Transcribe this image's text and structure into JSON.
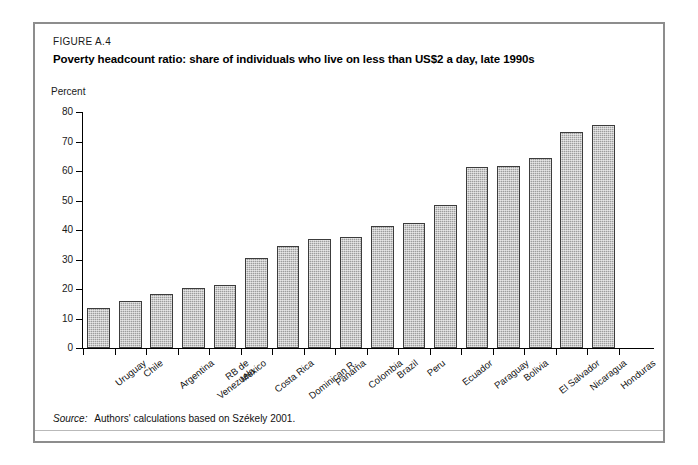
{
  "figure": {
    "number": "FIGURE A.4",
    "title": "Poverty headcount ratio: share of individuals who live on less than US$2 a day, late 1990s",
    "source_word": "Source:",
    "source_text": "Authors' calculations based on Székely 2001."
  },
  "chart_data": {
    "type": "bar",
    "title": "Poverty headcount ratio: share of individuals who live on less than US$2 a day, late 1990s",
    "xlabel": "",
    "ylabel": "Percent",
    "ylim": [
      0,
      80
    ],
    "yticks": [
      0,
      10,
      20,
      30,
      40,
      50,
      60,
      70,
      80
    ],
    "ytick_labels": [
      "0",
      "10",
      "20",
      "30",
      "40",
      "50",
      "60",
      "70",
      "80"
    ],
    "grid": false,
    "legend": "none",
    "bar_color": "#9d9d9d",
    "bar_border_color": "#3c3c3c",
    "categories": [
      "Uruguay",
      "Chile",
      "Argentina",
      "RB de Venezuela",
      "Mexico",
      "Costa Rica",
      "Dominican R.",
      "Panama",
      "Colombia",
      "Brazil",
      "Peru",
      "Ecuador",
      "Paraguay",
      "Bolivia",
      "El Salvador",
      "Nicaragua",
      "Honduras"
    ],
    "category_lines": [
      [
        "Uruguay"
      ],
      [
        "Chile"
      ],
      [
        "Argentina"
      ],
      [
        "RB de",
        "Venezuela"
      ],
      [
        "Mexico"
      ],
      [
        "Costa Rica"
      ],
      [
        "Dominican R."
      ],
      [
        "Panama"
      ],
      [
        "Colombia"
      ],
      [
        "Brazil"
      ],
      [
        "Peru"
      ],
      [
        "Ecuador"
      ],
      [
        "Paraguay"
      ],
      [
        "Bolivia"
      ],
      [
        "El Salvador"
      ],
      [
        "Nicaragua"
      ],
      [
        "Honduras"
      ]
    ],
    "values": [
      13.7,
      15.8,
      18.2,
      20.5,
      21.3,
      30.6,
      34.5,
      36.8,
      37.8,
      41.5,
      42.5,
      48.5,
      61.5,
      61.8,
      64.4,
      73.2,
      75.6
    ]
  }
}
